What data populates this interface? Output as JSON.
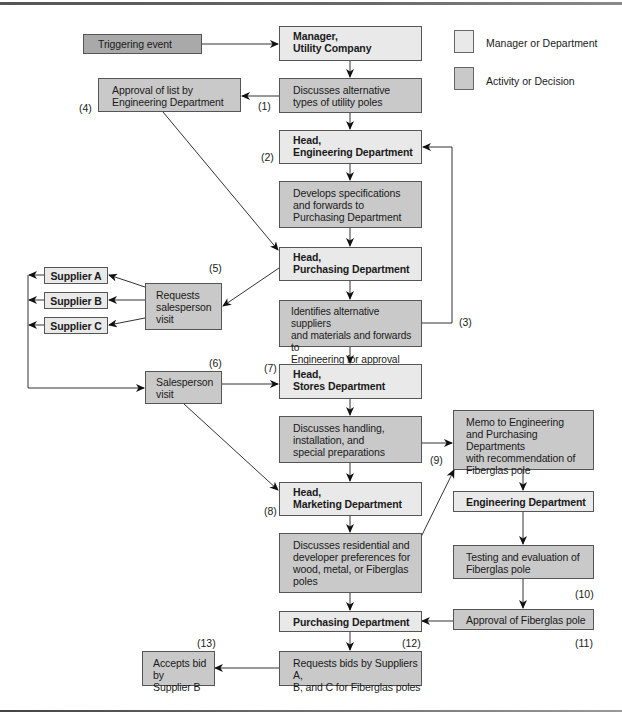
{
  "legend": {
    "manager_label": "Manager or Department",
    "activity_label": "Activity or Decision",
    "manager_color": "#e9e9e9",
    "activity_color": "#c9c9c9"
  },
  "colors": {
    "manager_fill": "#e9e9e9",
    "activity_fill": "#c9c9c9",
    "trigger_fill": "#a9a9a9",
    "border": "#555555",
    "line": "#333333"
  },
  "nodes": {
    "trigger": "Triggering event",
    "manager_utility": "Manager,\nUtility Company",
    "discusses_alternative": "Discusses alternative\ntypes of utility poles",
    "approval_list": "Approval of list by\nEngineering Department",
    "head_engineering": "Head,\nEngineering Department",
    "develops_specs": "Develops specifications\nand forwards to\nPurchasing Department",
    "head_purchasing": "Head,\nPurchasing Department",
    "requests_salesperson": "Requests\nsalesperson\nvisit",
    "supplier_a": "Supplier A",
    "supplier_b": "Supplier B",
    "supplier_c": "Supplier C",
    "identifies_alternative": "Identifies alternative suppliers\nand materials and forwards to\nEngineering for approval",
    "salesperson_visit": "Salesperson\nvisit",
    "head_stores": "Head,\nStores Department",
    "discusses_handling": "Discusses handling,\ninstallation, and\nspecial preparations",
    "memo": "Memo to Engineering\nand Purchasing Departments\nwith recommendation of\nFiberglas pole",
    "head_marketing": "Head,\nMarketing Department",
    "engineering_dept": "Engineering Department",
    "discusses_residential": "Discusses residential and\ndeveloper preferences for\nwood, metal, or Fiberglas\npoles",
    "testing": "Testing and evaluation of\nFiberglas pole",
    "purchasing_dept": "Purchasing Department",
    "approval_fiberglas": "Approval of Fiberglas pole",
    "requests_bids": "Requests bids by Suppliers A,\nB, and C for Fiberglas poles",
    "accepts_bid": "Accepts bid by\nSupplier B"
  },
  "step_labels": {
    "s1": "(1)",
    "s2": "(2)",
    "s3": "(3)",
    "s4": "(4)",
    "s5": "(5)",
    "s6": "(6)",
    "s7": "(7)",
    "s8": "(8)",
    "s9": "(9)",
    "s10": "(10)",
    "s11": "(11)",
    "s12": "(12)",
    "s13": "(13)"
  }
}
